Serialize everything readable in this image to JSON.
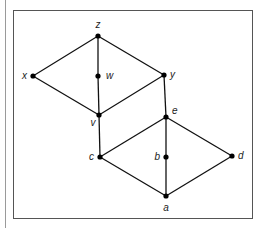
{
  "diagram": {
    "type": "graph",
    "nodes": [
      {
        "id": "z",
        "label": "z",
        "x": 98,
        "y": 36,
        "lx": 98,
        "ly": 28,
        "anchor": "middle"
      },
      {
        "id": "x",
        "label": "x",
        "x": 33,
        "y": 76,
        "lx": 27,
        "ly": 79,
        "anchor": "end"
      },
      {
        "id": "w",
        "label": "w",
        "x": 98,
        "y": 76,
        "lx": 106,
        "ly": 79,
        "anchor": "start"
      },
      {
        "id": "y",
        "label": "y",
        "x": 164,
        "y": 75,
        "lx": 170,
        "ly": 78,
        "anchor": "start"
      },
      {
        "id": "v",
        "label": "v",
        "x": 99,
        "y": 115,
        "lx": 93,
        "ly": 126,
        "anchor": "middle"
      },
      {
        "id": "e",
        "label": "e",
        "x": 166,
        "y": 117,
        "lx": 172,
        "ly": 114,
        "anchor": "start"
      },
      {
        "id": "c",
        "label": "c",
        "x": 100,
        "y": 157,
        "lx": 94,
        "ly": 160,
        "anchor": "end"
      },
      {
        "id": "b",
        "label": "b",
        "x": 166,
        "y": 157,
        "lx": 160,
        "ly": 160,
        "anchor": "end"
      },
      {
        "id": "d",
        "label": "d",
        "x": 232,
        "y": 156,
        "lx": 238,
        "ly": 159,
        "anchor": "start"
      },
      {
        "id": "a",
        "label": "a",
        "x": 166,
        "y": 196,
        "lx": 166,
        "ly": 211,
        "anchor": "middle"
      }
    ],
    "edges": [
      [
        "z",
        "x"
      ],
      [
        "z",
        "w"
      ],
      [
        "z",
        "y"
      ],
      [
        "x",
        "v"
      ],
      [
        "w",
        "v"
      ],
      [
        "y",
        "v"
      ],
      [
        "y",
        "e"
      ],
      [
        "v",
        "c"
      ],
      [
        "e",
        "c"
      ],
      [
        "e",
        "b"
      ],
      [
        "e",
        "d"
      ],
      [
        "c",
        "a"
      ],
      [
        "b",
        "a"
      ],
      [
        "d",
        "a"
      ]
    ],
    "colors": {
      "line": "#111111",
      "node": "#000000",
      "frame": "#555555"
    }
  }
}
